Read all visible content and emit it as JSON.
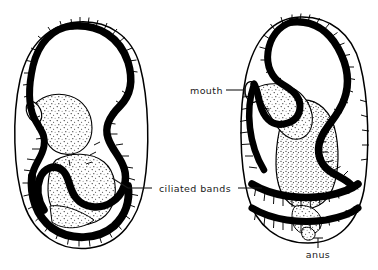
{
  "figure": {
    "background_color": "#ffffff",
    "ink_color": "#000000",
    "label_color": "#1a1a1a",
    "width": 378,
    "height": 270
  },
  "labels": {
    "mouth": "mouth",
    "ciliated_bands": "ciliated bands",
    "anus": "anus"
  },
  "specimens": [
    {
      "id": "left-larva",
      "name": "left-larva",
      "description": "Larva in lateral view with looping ciliated band and stippled gut"
    },
    {
      "id": "right-larva",
      "name": "right-larva",
      "description": "Larva in ventral view with large stippled stomach, mouth, two transverse ciliated bands and anus"
    }
  ],
  "structures": {
    "ciliated_band": "ciliated-band",
    "body_wall": "body-wall",
    "gut": "gut",
    "stomach": "stomach",
    "mouth_opening": "mouth-opening",
    "anus_opening": "anus-opening"
  }
}
